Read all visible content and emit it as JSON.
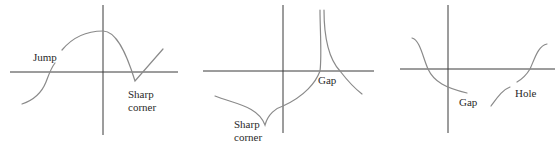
{
  "figure": {
    "panels": [
      {
        "id": "panel-1",
        "labels": {
          "jump": "Jump",
          "sharp_corner_line1": "Sharp",
          "sharp_corner_line2": "corner"
        }
      },
      {
        "id": "panel-2",
        "labels": {
          "gap": "Gap",
          "sharp_corner_line1": "Sharp",
          "sharp_corner_line2": "corner"
        }
      },
      {
        "id": "panel-3",
        "labels": {
          "gap": "Gap",
          "hole": "Hole"
        }
      }
    ],
    "colors": {
      "axis": "#3a3a3a",
      "curve": "#8a8a8a",
      "text": "#2a2a2a",
      "background": "#ffffff"
    }
  }
}
